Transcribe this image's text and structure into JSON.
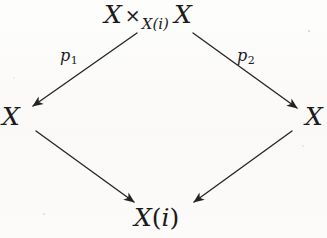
{
  "diagram": {
    "type": "commutative-diagram",
    "shape": "pullback-square-rotated",
    "nodes": {
      "top": {
        "id": "fiber-product",
        "base": "X",
        "operator": "×",
        "subscript": "X(i)",
        "second": "X",
        "full_text": "X ×_{X(i)} X"
      },
      "left": {
        "id": "left-X",
        "full_text": "X"
      },
      "right": {
        "id": "right-X",
        "full_text": "X"
      },
      "bottom": {
        "id": "base-object",
        "base": "X",
        "open_paren": "(",
        "index": "i",
        "close_paren": ")",
        "full_text": "X(i)"
      }
    },
    "edge_labels": {
      "p1": {
        "base": "p",
        "sub": "1",
        "full_text": "p₁"
      },
      "p2": {
        "base": "p",
        "sub": "2",
        "full_text": "p₂"
      }
    },
    "edges": [
      {
        "id": "top-to-left",
        "from": "top",
        "to": "left",
        "label": "p₁"
      },
      {
        "id": "top-to-right",
        "from": "top",
        "to": "right",
        "label": "p₂"
      },
      {
        "id": "left-to-bottom",
        "from": "left",
        "to": "bottom",
        "label": ""
      },
      {
        "id": "right-to-bottom",
        "from": "right",
        "to": "bottom",
        "label": ""
      }
    ],
    "colors": {
      "ink": "#1b1b1b",
      "paper": "#fbfbfa"
    }
  }
}
